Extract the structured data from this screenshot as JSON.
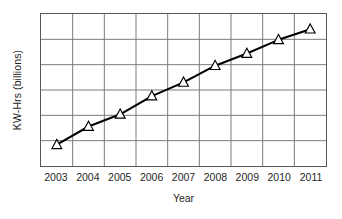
{
  "chart_data": {
    "type": "line",
    "title": "",
    "xlabel": "Year",
    "ylabel": "KW-Hrs (billions)",
    "categories": [
      "2003",
      "2004",
      "2005",
      "2006",
      "2007",
      "2008",
      "2009",
      "2010",
      "2011"
    ],
    "values": [
      0.14,
      0.26,
      0.34,
      0.46,
      0.55,
      0.66,
      0.74,
      0.83,
      0.9
    ],
    "ylim": [
      0,
      1
    ],
    "y_tick_labels": [],
    "grid": true,
    "grid_vertical_lines": 8,
    "grid_horizontal_lines": 5,
    "legend": null,
    "legend_position": "none",
    "series": [
      {
        "name": "KW-Hrs (billions)",
        "marker": "triangle-open",
        "line_color": "#000000",
        "marker_fill": "#ffffff",
        "marker_edge": "#000000",
        "values": [
          0.14,
          0.26,
          0.34,
          0.46,
          0.55,
          0.66,
          0.74,
          0.83,
          0.9
        ]
      }
    ],
    "annotations": []
  },
  "colors": {
    "background": "#ffffff",
    "frame": "#555555",
    "grid": "#7a7a7a",
    "line": "#000000",
    "marker_fill": "#ffffff",
    "text": "#1f1f1f"
  }
}
